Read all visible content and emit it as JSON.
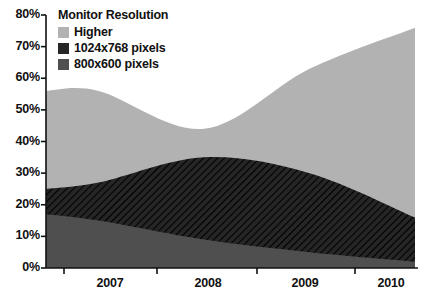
{
  "chart_data": {
    "type": "area",
    "title": "",
    "xlabel": "",
    "ylabel": "",
    "stacked": true,
    "grid": false,
    "legend_position": "top-left",
    "legend_title": "Monitor Resolution",
    "x": [
      2006.5,
      2007,
      2008,
      2009,
      2010
    ],
    "xtick_labels": [
      "2007",
      "2008",
      "2009",
      "2010"
    ],
    "xlim": [
      2006.5,
      2010
    ],
    "ylim": [
      0,
      80
    ],
    "ytick_labels": [
      "0%",
      "10%",
      "20%",
      "30%",
      "40%",
      "50%",
      "60%",
      "70%",
      "80%"
    ],
    "ytick_values": [
      0,
      10,
      20,
      30,
      40,
      50,
      60,
      70,
      80
    ],
    "series": [
      {
        "name": "800x600 pixels",
        "color": "#4f4f4f",
        "values": [
          17,
          15,
          9,
          5,
          2
        ]
      },
      {
        "name": "1024x768 pixels",
        "color": "#262626",
        "hatch": "diagonal",
        "values": [
          8,
          12,
          26,
          25,
          14
        ]
      },
      {
        "name": "Higher",
        "color": "#b2b2b2",
        "values": [
          31,
          29,
          9,
          33,
          60
        ]
      }
    ],
    "stack_tops": {
      "800x600 pixels": [
        17,
        15,
        9,
        5,
        2
      ],
      "1024x768 pixels": [
        25,
        27,
        35,
        30,
        16
      ],
      "Higher": [
        56,
        56,
        44,
        63,
        76
      ]
    }
  },
  "axis": {
    "y_ticks": [
      {
        "label": "80%",
        "value": 80
      },
      {
        "label": "70%",
        "value": 70
      },
      {
        "label": "60%",
        "value": 60
      },
      {
        "label": "50%",
        "value": 50
      },
      {
        "label": "40%",
        "value": 40
      },
      {
        "label": "30%",
        "value": 30
      },
      {
        "label": "20%",
        "value": 20
      },
      {
        "label": "10%",
        "value": 10
      },
      {
        "label": "0%",
        "value": 0
      }
    ],
    "x_ticks": [
      {
        "label": "2007"
      },
      {
        "label": "2008"
      },
      {
        "label": "2009"
      },
      {
        "label": "2010"
      }
    ]
  },
  "legend": {
    "title": "Monitor Resolution",
    "items": [
      {
        "label": "Higher",
        "color": "#b2b2b2"
      },
      {
        "label": "1024x768 pixels",
        "color": "#262626"
      },
      {
        "label": "800x600 pixels",
        "color": "#4f4f4f"
      }
    ]
  },
  "colors": {
    "higher": "#b2b2b2",
    "xga": "#262626",
    "svga": "#4f4f4f",
    "axis": "#111111",
    "background": "#ffffff"
  }
}
